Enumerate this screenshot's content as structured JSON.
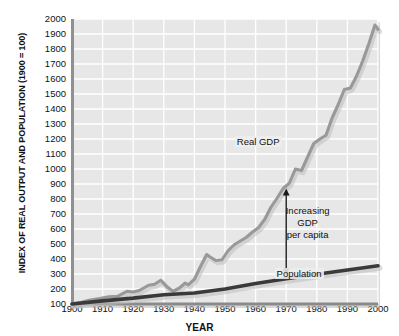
{
  "chart_data": {
    "type": "line",
    "title": "",
    "xlabel": "YEAR",
    "ylabel": "INDEX OF REAL OUTPUT AND POPULATION (1900 = 100)",
    "xlim": [
      1900,
      2000
    ],
    "ylim": [
      100,
      2000
    ],
    "grid": true,
    "legend_position": "inline-annotations",
    "xticks": [
      1900,
      1910,
      1920,
      1930,
      1940,
      1950,
      1960,
      1970,
      1980,
      1990,
      2000
    ],
    "yticks": [
      100,
      200,
      300,
      400,
      500,
      600,
      700,
      800,
      900,
      1000,
      1100,
      1200,
      1300,
      1400,
      1500,
      1600,
      1700,
      1800,
      1900,
      2000
    ],
    "series": [
      {
        "name": "Real GDP",
        "color": "#999999",
        "x": [
          1900,
          1903,
          1906,
          1909,
          1912,
          1915,
          1918,
          1920,
          1922,
          1925,
          1927,
          1929,
          1931,
          1933,
          1935,
          1937,
          1938,
          1940,
          1942,
          1944,
          1945,
          1947,
          1949,
          1951,
          1953,
          1955,
          1957,
          1959,
          1961,
          1963,
          1965,
          1967,
          1969,
          1971,
          1973,
          1975,
          1977,
          1979,
          1981,
          1983,
          1985,
          1987,
          1989,
          1991,
          1993,
          1995,
          1997,
          1999,
          2000
        ],
        "y": [
          100,
          112,
          126,
          136,
          148,
          152,
          185,
          180,
          190,
          225,
          232,
          258,
          215,
          185,
          205,
          240,
          228,
          265,
          350,
          430,
          415,
          390,
          395,
          455,
          495,
          520,
          545,
          580,
          610,
          665,
          745,
          805,
          870,
          905,
          1000,
          990,
          1080,
          1170,
          1200,
          1225,
          1340,
          1430,
          1530,
          1540,
          1620,
          1720,
          1835,
          1960,
          1930
        ],
        "note": "Real GDP index, 1900 = 100; Depression trough near 1933, WWII surge to mid-1940s, steady postwar growth to about 1960 at end of century"
      },
      {
        "name": "Population",
        "color": "#3a3a3a",
        "x": [
          1900,
          1910,
          1920,
          1930,
          1940,
          1950,
          1960,
          1970,
          1980,
          1990,
          2000
        ],
        "y": [
          100,
          121,
          139,
          162,
          173,
          200,
          236,
          268,
          298,
          327,
          355
        ],
        "note": "U.S. population index, 1900 = 100"
      }
    ],
    "annotations": [
      {
        "id": "real-gdp-label",
        "text": "Real GDP",
        "x": 1963,
        "y": 1180
      },
      {
        "id": "population-label",
        "text": "Population",
        "x": 1977,
        "y": 300
      },
      {
        "id": "increasing-gdp-per-capita",
        "lines": [
          "Increasing",
          "GDP",
          "per capita"
        ],
        "x": 1979,
        "y": 640
      },
      {
        "id": "gdp-per-capita-arrow",
        "type": "double-arrow",
        "x": 1970,
        "y_top": 870,
        "y_bottom": 290
      }
    ]
  },
  "axis_label_x": "YEAR",
  "axis_label_y": "INDEX OF REAL OUTPUT AND POPULATION (1900 = 100)",
  "colors": {
    "plot_background": "#e7e7e7",
    "gridline": "#ffffff",
    "axis_line": "#8a8a8a",
    "gdp_line": "#999999",
    "population_line": "#3a3a3a",
    "text": "#111111"
  }
}
